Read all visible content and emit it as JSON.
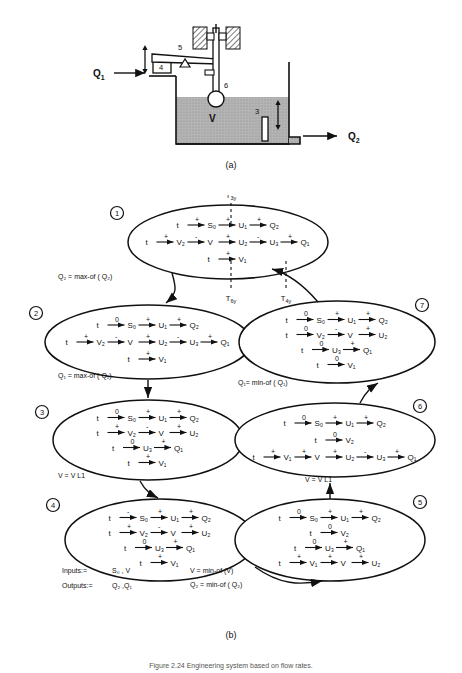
{
  "figure": {
    "panel_a_label": "(a)",
    "panel_b_label": "(b)",
    "caption": "Figure 2.24  Engineering system based on flow rates."
  },
  "panel_a": {
    "inflow_label": "Q",
    "inflow_sub": "1",
    "outflow_label": "Q",
    "outflow_sub": "2",
    "tank_label": "V",
    "part_5": "5",
    "part_4": "4",
    "part_6": "6",
    "part_3": "3"
  },
  "panel_b": {
    "dashed_labels": [
      {
        "text": "T",
        "sub": "3y",
        "position": "top"
      },
      {
        "text": "T",
        "sub": "6y",
        "position": "bottom"
      },
      {
        "text": "T",
        "sub": "4y",
        "position": "bottom"
      }
    ],
    "transitions": [
      {
        "id": "t1-2",
        "label": "Q₂ = max-of ( Q₂)"
      },
      {
        "id": "t2-3",
        "label": "Q₁ = max-of ( Q₁)"
      },
      {
        "id": "t3-4",
        "label": "V = V L1"
      },
      {
        "id": "t5-6",
        "label": "V = V L1"
      },
      {
        "id": "t6-7",
        "label": "Q₁= min-of ( Q₁)"
      },
      {
        "id": "t4-5a",
        "label": "V = min-of (V)"
      },
      {
        "id": "t4-5b",
        "label": "Q₂  = min-of ( Q₂)"
      }
    ],
    "legend": {
      "inputs_label": "Inputs:=",
      "inputs_value": "S₀ , V",
      "outputs_label": "Outputs:=",
      "outputs_value": "Q₂ ,Q₁"
    },
    "states": [
      {
        "number": "1",
        "rows": [
          {
            "chain": [
              {
                "n": "t"
              },
              {
                "s": "+"
              },
              {
                "n": "S₀"
              },
              {
                "s": "+"
              },
              {
                "n": "U₁"
              },
              {
                "s": "+"
              },
              {
                "n": "Q₂"
              }
            ]
          },
          {
            "chain": [
              {
                "n": "t"
              },
              {
                "s": "+"
              },
              {
                "n": "V₂"
              },
              {
                "s": "-"
              },
              {
                "n": "V"
              },
              {
                "s": "+"
              },
              {
                "n": "U₂"
              },
              {
                "s": "-"
              },
              {
                "n": "U₃"
              },
              {
                "s": "+"
              },
              {
                "n": "Q₁"
              }
            ]
          },
          {
            "chain": [
              {
                "n": "t"
              },
              {
                "s": "+"
              },
              {
                "n": "V₁"
              }
            ]
          }
        ]
      },
      {
        "number": "2",
        "rows": [
          {
            "chain": [
              {
                "n": "t"
              },
              {
                "s": "0"
              },
              {
                "n": "S₀"
              },
              {
                "s": "+"
              },
              {
                "n": "U₁"
              },
              {
                "s": "+"
              },
              {
                "n": "Q₂"
              }
            ]
          },
          {
            "chain": [
              {
                "n": "t"
              },
              {
                "s": "+"
              },
              {
                "n": "V₂"
              },
              {
                "s": "-"
              },
              {
                "n": "V"
              },
              {
                "s": "+"
              },
              {
                "n": "U₂"
              },
              {
                "s": "-"
              },
              {
                "n": "U₃"
              },
              {
                "s": "+"
              },
              {
                "n": "Q₁"
              }
            ]
          },
          {
            "chain": [
              {
                "n": "t"
              },
              {
                "s": "+"
              },
              {
                "n": "V₁"
              }
            ]
          }
        ]
      },
      {
        "number": "3",
        "rows": [
          {
            "chain": [
              {
                "n": "t"
              },
              {
                "s": "0"
              },
              {
                "n": "S₀"
              },
              {
                "s": "+"
              },
              {
                "n": "U₁"
              },
              {
                "s": "+"
              },
              {
                "n": "Q₂"
              }
            ]
          },
          {
            "chain": [
              {
                "n": "t"
              },
              {
                "s": "+"
              },
              {
                "n": "V₂"
              },
              {
                "s": "-"
              },
              {
                "n": "V"
              },
              {
                "s": "+"
              },
              {
                "n": "U₂"
              }
            ]
          },
          {
            "chain": [
              {
                "n": "t"
              },
              {
                "s": "0"
              },
              {
                "n": "U₃"
              },
              {
                "s": "+"
              },
              {
                "n": "Q₁"
              }
            ]
          },
          {
            "chain": [
              {
                "n": "t"
              },
              {
                "s": "+"
              },
              {
                "n": "V₁"
              }
            ]
          }
        ]
      },
      {
        "number": "4",
        "rows": [
          {
            "chain": [
              {
                "n": "t"
              },
              {
                "s": "-"
              },
              {
                "n": "S₀"
              },
              {
                "s": "+"
              },
              {
                "n": "U₁"
              },
              {
                "s": "+"
              },
              {
                "n": "Q₂"
              }
            ]
          },
          {
            "chain": [
              {
                "n": "t"
              },
              {
                "s": "+"
              },
              {
                "n": "V₂"
              },
              {
                "s": "-"
              },
              {
                "n": "V"
              },
              {
                "s": "+"
              },
              {
                "n": "U₂"
              }
            ]
          },
          {
            "chain": [
              {
                "n": "t"
              },
              {
                "s": "0"
              },
              {
                "n": "U₃"
              },
              {
                "s": "+"
              },
              {
                "n": "Q₁"
              }
            ]
          },
          {
            "chain": [
              {
                "n": "t"
              },
              {
                "s": "+"
              },
              {
                "n": "V₁"
              }
            ]
          }
        ]
      },
      {
        "number": "5",
        "rows": [
          {
            "chain": [
              {
                "n": "t"
              },
              {
                "s": "0"
              },
              {
                "n": "S₀"
              },
              {
                "s": "+"
              },
              {
                "n": "U₁"
              },
              {
                "s": "+"
              },
              {
                "n": "Q₂"
              }
            ]
          },
          {
            "chain": [
              {
                "n": "t"
              },
              {
                "s": "0"
              },
              {
                "n": "V₂"
              }
            ]
          },
          {
            "chain": [
              {
                "n": "t"
              },
              {
                "s": "0"
              },
              {
                "n": "U₃"
              },
              {
                "s": "+"
              },
              {
                "n": "Q₁"
              }
            ]
          },
          {
            "chain": [
              {
                "n": "t"
              },
              {
                "s": "+"
              },
              {
                "n": "V₁"
              },
              {
                "s": "+"
              },
              {
                "n": "V"
              },
              {
                "s": "+"
              },
              {
                "n": "U₂"
              }
            ]
          }
        ]
      },
      {
        "number": "6",
        "rows": [
          {
            "chain": [
              {
                "n": "t"
              },
              {
                "s": "0"
              },
              {
                "n": "S₀"
              },
              {
                "s": "+"
              },
              {
                "n": "U₁"
              },
              {
                "s": "+"
              },
              {
                "n": "Q₂"
              }
            ]
          },
          {
            "chain": [
              {
                "n": "t"
              },
              {
                "s": "0"
              },
              {
                "n": "V₂"
              }
            ]
          },
          {
            "chain": [
              {
                "n": "t"
              },
              {
                "s": "+"
              },
              {
                "n": "V₁"
              },
              {
                "s": "+"
              },
              {
                "n": "V"
              },
              {
                "s": "+"
              },
              {
                "n": "U₂"
              },
              {
                "s": "-"
              },
              {
                "n": "U₃"
              },
              {
                "s": "+"
              },
              {
                "n": "Q₁"
              }
            ]
          }
        ]
      },
      {
        "number": "7",
        "rows": [
          {
            "chain": [
              {
                "n": "t"
              },
              {
                "s": "0"
              },
              {
                "n": "S₀"
              },
              {
                "s": "+"
              },
              {
                "n": "U₁"
              },
              {
                "s": "+"
              },
              {
                "n": "Q₂"
              }
            ]
          },
          {
            "chain": [
              {
                "n": "t"
              },
              {
                "s": "0"
              },
              {
                "n": "V₂"
              },
              {
                "s": "-"
              },
              {
                "n": "V"
              },
              {
                "s": "+"
              },
              {
                "n": "U₂"
              }
            ]
          },
          {
            "chain": [
              {
                "n": "t"
              },
              {
                "s": "0"
              },
              {
                "n": "U₃"
              },
              {
                "s": "+"
              },
              {
                "n": "Q₁"
              }
            ]
          },
          {
            "chain": [
              {
                "n": "t"
              },
              {
                "s": "0"
              },
              {
                "n": "V₁"
              }
            ]
          }
        ]
      }
    ]
  },
  "colors": {
    "ink": "#111111",
    "water_fill": "#a8a8a8",
    "hatch": "#111111"
  }
}
